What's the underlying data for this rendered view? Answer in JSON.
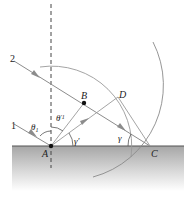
{
  "figure": {
    "colors": {
      "background": "#ffffff",
      "surface_line": "#555555",
      "surface_fill_top": "#a6a6a6",
      "surface_fill_bottom": "#ffffff",
      "ray": "#8c8c8c",
      "arc": "#9a9a9a",
      "arrow": "#8c8c8c",
      "dashed_normal": "#444444",
      "point": "#111111",
      "text": "#222222"
    },
    "labels": {
      "ray1": "1",
      "ray2": "2",
      "pointA": "A",
      "pointB": "B",
      "pointC": "C",
      "pointD": "D",
      "theta1": "θ",
      "theta1_sub": "1",
      "theta1_prime": "θ",
      "theta1_prime_sub": "′1",
      "gamma_prime": "γ′",
      "gamma": "γ"
    },
    "points": {
      "A": [
        51,
        146
      ],
      "B": [
        84,
        103
      ],
      "C": [
        150,
        146
      ],
      "D": [
        118,
        97
      ]
    }
  }
}
